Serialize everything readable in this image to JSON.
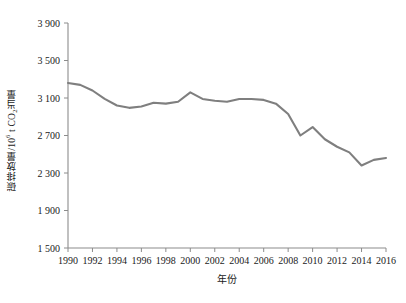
{
  "chart_data": {
    "type": "line",
    "title": "",
    "xlabel": "年份",
    "ylabel": "碳排放量/10⁶ t CO₂当量",
    "ylabel_parts": {
      "prefix": "碳排放量/10",
      "exp": "6",
      "mid": " t CO",
      "sub": "2",
      "suffix": "当量"
    },
    "x": [
      1990,
      1991,
      1992,
      1993,
      1994,
      1995,
      1996,
      1997,
      1998,
      1999,
      2000,
      2001,
      2002,
      2003,
      2004,
      2005,
      2006,
      2007,
      2008,
      2009,
      2010,
      2011,
      2012,
      2013,
      2014,
      2015,
      2016
    ],
    "values": [
      3260,
      3240,
      3180,
      3090,
      3020,
      2995,
      3010,
      3050,
      3040,
      3060,
      3160,
      3090,
      3070,
      3060,
      3090,
      3090,
      3080,
      3040,
      2930,
      2700,
      2790,
      2660,
      2580,
      2520,
      2380,
      2440,
      2460
    ],
    "series": [
      {
        "name": "碳排放量",
        "color": "#7f7f7f",
        "values": [
          3260,
          3240,
          3180,
          3090,
          3020,
          2995,
          3010,
          3050,
          3040,
          3060,
          3160,
          3090,
          3070,
          3060,
          3090,
          3090,
          3080,
          3040,
          2930,
          2700,
          2790,
          2660,
          2580,
          2520,
          2380,
          2440,
          2460
        ]
      }
    ],
    "xlim": [
      1990,
      2016
    ],
    "ylim": [
      1500,
      3900
    ],
    "yticks": [
      1500,
      1900,
      2300,
      2700,
      3100,
      3500,
      3900
    ],
    "ytick_labels": [
      "1 500",
      "1 900",
      "2 300",
      "2 700",
      "3 100",
      "3 500",
      "3 900"
    ],
    "xticks": [
      1990,
      1992,
      1994,
      1996,
      1998,
      2000,
      2002,
      2004,
      2006,
      2008,
      2010,
      2012,
      2014,
      2016
    ],
    "xtick_labels": [
      "1990",
      "1992",
      "1994",
      "1996",
      "1998",
      "2000",
      "2002",
      "2004",
      "2006",
      "2008",
      "2010",
      "2012",
      "2014",
      "2016"
    ],
    "grid": false,
    "legend": "none",
    "line_color": "#7f7f7f",
    "axis_color": "#8c8c8c",
    "background": "#ffffff"
  }
}
